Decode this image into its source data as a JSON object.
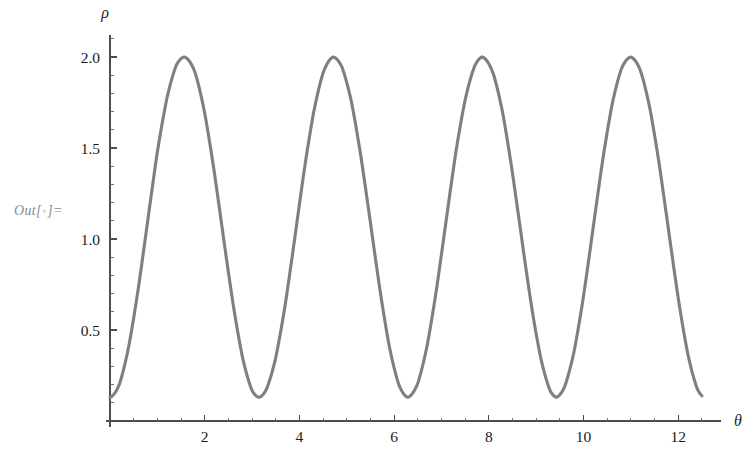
{
  "notebook": {
    "out_prefix": "Out[",
    "out_dot": "▫",
    "out_suffix": "]="
  },
  "chart_data": {
    "type": "line",
    "title": "",
    "subtitle": "",
    "xlabel": "θ",
    "ylabel": "ρ",
    "xlim": [
      0,
      12.9
    ],
    "ylim": [
      0,
      2.12
    ],
    "grid": false,
    "legend": null,
    "x_ticks_major": [
      2,
      4,
      6,
      8,
      10,
      12
    ],
    "x_tick_labels": [
      "2",
      "4",
      "6",
      "8",
      "10",
      "12"
    ],
    "x_ticks_minor": [
      0.5,
      1,
      1.5,
      2.5,
      3,
      3.5,
      4.5,
      5,
      5.5,
      6.5,
      7,
      7.5,
      8.5,
      9,
      9.5,
      10.5,
      11,
      11.5,
      12.5
    ],
    "y_ticks_major": [
      0.5,
      1.0,
      1.5,
      2.0
    ],
    "y_tick_labels": [
      "0.5",
      "1.0",
      "1.5",
      "2.0"
    ],
    "y_ticks_minor": [
      0.1,
      0.2,
      0.3,
      0.4,
      0.6,
      0.7,
      0.8,
      0.9,
      1.1,
      1.2,
      1.3,
      1.4,
      1.6,
      1.7,
      1.8,
      1.9,
      2.1
    ],
    "series": [
      {
        "name": "rho(theta)",
        "color": "#7f7f7f",
        "line_width": 3.1,
        "formula": "rho = 1.065 - 0.935*cos(2*theta)",
        "period": 3.14159,
        "peak_value": 2.0,
        "trough_value": 0.13,
        "peaks_theta": [
          1.571,
          4.712,
          7.854,
          10.996
        ],
        "troughs_theta": [
          3.142,
          6.283,
          9.425
        ],
        "x": [
          0.0,
          0.2,
          0.4,
          0.6,
          0.8,
          1.0,
          1.2,
          1.4,
          1.571,
          1.8,
          2.0,
          2.2,
          2.4,
          2.6,
          2.8,
          3.0,
          3.142,
          3.3,
          3.5,
          3.7,
          3.9,
          4.1,
          4.3,
          4.5,
          4.712,
          4.9,
          5.1,
          5.3,
          5.5,
          5.7,
          5.9,
          6.1,
          6.283,
          6.5,
          6.7,
          6.9,
          7.1,
          7.3,
          7.5,
          7.7,
          7.854,
          8.1,
          8.3,
          8.5,
          8.7,
          8.9,
          9.1,
          9.3,
          9.425,
          9.6,
          9.8,
          10.0,
          10.2,
          10.4,
          10.6,
          10.8,
          10.996,
          11.2,
          11.4,
          11.6,
          11.8,
          12.0,
          12.2,
          12.4,
          12.5
        ],
        "y": [
          0.13,
          0.2,
          0.42,
          0.75,
          1.15,
          1.55,
          1.82,
          1.98,
          2.0,
          1.94,
          1.74,
          1.43,
          1.06,
          0.69,
          0.37,
          0.17,
          0.13,
          0.16,
          0.31,
          0.59,
          0.96,
          1.35,
          1.68,
          1.9,
          2.0,
          1.97,
          1.81,
          1.53,
          1.18,
          0.8,
          0.46,
          0.22,
          0.13,
          0.18,
          0.36,
          0.66,
          1.04,
          1.43,
          1.73,
          1.93,
          2.0,
          1.95,
          1.78,
          1.48,
          1.12,
          0.74,
          0.41,
          0.18,
          0.13,
          0.19,
          0.38,
          0.69,
          1.08,
          1.46,
          1.77,
          1.95,
          2.0,
          1.94,
          1.75,
          1.45,
          1.08,
          0.7,
          0.38,
          0.17,
          0.14
        ]
      }
    ]
  }
}
